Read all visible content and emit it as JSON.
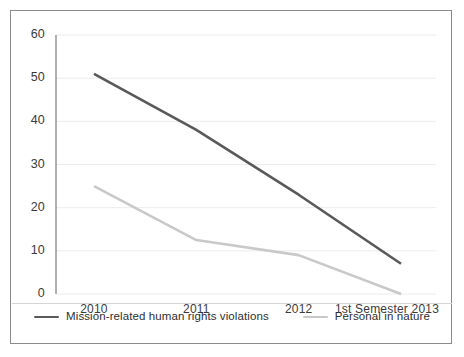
{
  "chart_data": {
    "type": "line",
    "title": "",
    "xlabel": "",
    "ylabel": "",
    "categories": [
      "2010",
      "2011",
      "2012",
      "1st Semester 2013"
    ],
    "ylim": [
      0,
      60
    ],
    "yticks": [
      0,
      10,
      20,
      30,
      40,
      50,
      60
    ],
    "ytick_labels": [
      "0",
      "10",
      "20",
      "30",
      "40",
      "50",
      "60"
    ],
    "grid": true,
    "grid_color": "#ececec",
    "legend_position": "bottom",
    "series": [
      {
        "name": "Mission-related human rights violations",
        "color": "#595959",
        "values": [
          51,
          38,
          23,
          7
        ]
      },
      {
        "name": "Personal in nature",
        "color": "#c9c9c9",
        "values": [
          25,
          12.5,
          9,
          0
        ]
      }
    ]
  },
  "axis": {
    "y_labels": [
      "60",
      "50",
      "40",
      "30",
      "20",
      "10",
      "0"
    ],
    "x_labels": [
      "2010",
      "2011",
      "2012",
      "1st Semester 2013"
    ]
  },
  "legend": {
    "items": [
      {
        "label": "Mission-related human rights violations",
        "color": "#595959"
      },
      {
        "label": "Personal in nature",
        "color": "#c9c9c9"
      }
    ]
  },
  "colors": {
    "series_primary": "#595959",
    "series_secondary": "#c9c9c9",
    "border": "#8a8a8a",
    "gridline": "#ececec",
    "axis_line": "#7d7d7d",
    "text": "#3a3a3a"
  }
}
